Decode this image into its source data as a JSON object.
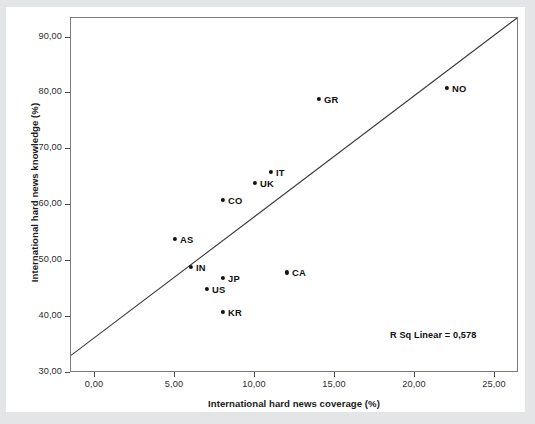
{
  "chart_data": {
    "type": "scatter",
    "title": "",
    "xlabel": "International hard news coverage (%)",
    "ylabel": "International hard news knowledge (%)",
    "xlim": [
      -1.5,
      26.5
    ],
    "ylim": [
      30.0,
      93.5
    ],
    "xticks": [
      0,
      5,
      10,
      15,
      20,
      25
    ],
    "xticklabels": [
      "0,00",
      "5,00",
      "10,00",
      "15,00",
      "20,00",
      "25,00"
    ],
    "yticks": [
      30,
      40,
      50,
      60,
      70,
      80,
      90
    ],
    "yticklabels": [
      "30,00",
      "40,00",
      "50,00",
      "60,00",
      "70,00",
      "80,00",
      "90,00"
    ],
    "grid": false,
    "legend": null,
    "annotation": "R Sq Linear = 0,578",
    "r_squared": 0.578,
    "points": [
      {
        "label": "AS",
        "x": 5.0,
        "y": 54.0,
        "label_side": "right"
      },
      {
        "label": "IN",
        "x": 6.0,
        "y": 49.0,
        "label_side": "right"
      },
      {
        "label": "US",
        "x": 7.0,
        "y": 45.0,
        "label_side": "right"
      },
      {
        "label": "JP",
        "x": 8.0,
        "y": 47.0,
        "label_side": "right"
      },
      {
        "label": "KR",
        "x": 8.0,
        "y": 41.0,
        "label_side": "right"
      },
      {
        "label": "CO",
        "x": 8.0,
        "y": 61.0,
        "label_side": "right"
      },
      {
        "label": "UK",
        "x": 10.0,
        "y": 64.0,
        "label_side": "right"
      },
      {
        "label": "IT",
        "x": 11.0,
        "y": 66.0,
        "label_side": "right"
      },
      {
        "label": "CA",
        "x": 12.0,
        "y": 48.0,
        "label_side": "right"
      },
      {
        "label": "GR",
        "x": 14.0,
        "y": 79.0,
        "label_side": "right"
      },
      {
        "label": "NO",
        "x": 22.0,
        "y": 81.0,
        "label_side": "right"
      }
    ],
    "fit_line": {
      "kind": "linear",
      "x_start": -1.5,
      "y_start": 32.8,
      "x_end": 26.5,
      "y_end": 93.5,
      "color": "#3a3a3a"
    },
    "colors": {
      "point": "#111111",
      "frame": "#7a7a7a",
      "line": "#3a3a3a",
      "background": "#ffffff",
      "page": "#e8e9ea"
    }
  }
}
